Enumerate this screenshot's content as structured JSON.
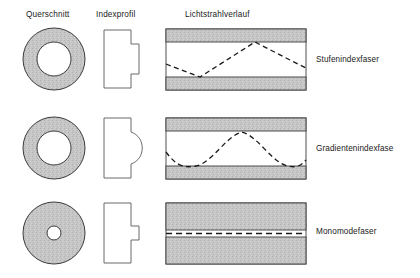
{
  "figure": {
    "headers": [
      {
        "key": "cross_section",
        "label": "Querschnitt"
      },
      {
        "key": "index_profile",
        "label": "Indexprofil"
      },
      {
        "key": "ray_path",
        "label": "Lichtstrahlverlauf"
      }
    ],
    "rows": [
      {
        "key": "step_index",
        "label": "Stufenindexfaser",
        "cross_section": {
          "shape": "annulus",
          "core": "large",
          "cladding_fill": "#c6c6c6"
        },
        "index_profile": {
          "shape": "rectangular-step",
          "core_step": "wide"
        },
        "ray_path": {
          "shape": "zigzag",
          "reflections": 2,
          "style": "dashed"
        }
      },
      {
        "key": "graded_index",
        "label": "Gradientenindexfase",
        "cross_section": {
          "shape": "annulus",
          "core": "large",
          "cladding_fill": "#c6c6c6"
        },
        "index_profile": {
          "shape": "parabolic-bulge",
          "core_step": "curved"
        },
        "ray_path": {
          "shape": "sinusoidal",
          "reflections": 2,
          "style": "dashed"
        }
      },
      {
        "key": "single_mode",
        "label": "Monomodefaser",
        "cross_section": {
          "shape": "annulus",
          "core": "small",
          "cladding_fill": "#c6c6c6"
        },
        "index_profile": {
          "shape": "rectangular-step",
          "core_step": "narrow"
        },
        "ray_path": {
          "shape": "straight",
          "reflections": 0,
          "style": "dashed"
        }
      }
    ],
    "colors": {
      "cladding": "#c6c6c6",
      "core": "#ffffff",
      "outline": "#3c3c3c",
      "ray": "#1a1a1a",
      "text": "#1a1a1a",
      "background": "#ffffff"
    }
  }
}
